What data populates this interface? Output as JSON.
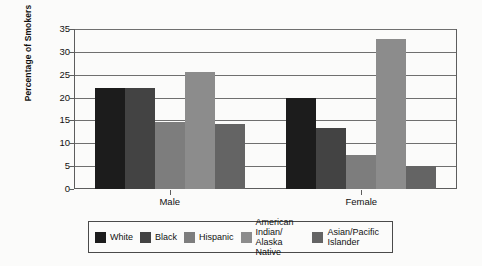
{
  "chart_data": {
    "type": "bar",
    "title": "",
    "subtitle": "",
    "xlabel": "",
    "ylabel": "Percentage of Smokers",
    "categories": [
      "Male",
      "Female"
    ],
    "ylim": [
      0,
      35
    ],
    "yticks": [
      0,
      5,
      10,
      15,
      20,
      25,
      30,
      35
    ],
    "ytick_labels": [
      "0",
      "5",
      "10",
      "15",
      "20",
      "25",
      "30",
      "35"
    ],
    "grid": true,
    "legend_position": "bottom",
    "series": [
      {
        "name": "White",
        "legend_label": "White",
        "color": "#1c1c1c",
        "values": [
          22.0,
          19.9
        ]
      },
      {
        "name": "Black",
        "legend_label": "Black",
        "color": "#434343",
        "values": [
          22.0,
          13.4
        ]
      },
      {
        "name": "Hispanic",
        "legend_label": "Hispanic",
        "color": "#7d7d7d",
        "values": [
          14.7,
          7.5
        ]
      },
      {
        "name": "American Indian/Alaska Native",
        "legend_label": "American Indian/\nAlaska Native",
        "color": "#8c8c8c",
        "values": [
          25.5,
          32.8
        ]
      },
      {
        "name": "Asian/Pacific Islander",
        "legend_label": "Asian/Pacific\nIslander",
        "color": "#646464",
        "values": [
          14.3,
          5.0
        ]
      }
    ]
  },
  "colors": {
    "axis": "#5d5d5d",
    "grid": "#6f6f6f",
    "text": "#111111",
    "background": "#fbfbfa",
    "legend_border": "#4a4a4a"
  }
}
